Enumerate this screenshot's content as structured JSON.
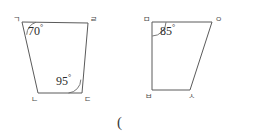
{
  "figures": [
    {
      "id": "left-quadrilateral",
      "vertices": [
        {
          "name": "top-left",
          "label": "ㄱ",
          "x": 22,
          "y": 22,
          "label_x": 13,
          "label_y": 16
        },
        {
          "name": "top-right",
          "label": "ㄹ",
          "x": 88,
          "y": 23,
          "label_x": 90,
          "label_y": 16
        },
        {
          "name": "bottom-right",
          "label": "ㄷ",
          "x": 82,
          "y": 93,
          "label_x": 84,
          "label_y": 96
        },
        {
          "name": "bottom-left",
          "label": "ㄴ",
          "x": 38,
          "y": 93,
          "label_x": 31,
          "label_y": 96
        }
      ],
      "angles": [
        {
          "at": "top-left",
          "value": "70",
          "degree": "°",
          "label_x": 28,
          "label_y": 24
        },
        {
          "at": "bottom-right",
          "value": "95",
          "degree": "°",
          "label_x": 56,
          "label_y": 74
        }
      ]
    },
    {
      "id": "right-quadrilateral",
      "vertices": [
        {
          "name": "top-left",
          "label": "ㅁ",
          "x": 152,
          "y": 22,
          "label_x": 143,
          "label_y": 16
        },
        {
          "name": "top-right",
          "label": "ㅇ",
          "x": 212,
          "y": 22,
          "label_x": 215,
          "label_y": 16
        },
        {
          "name": "bottom-right",
          "label": "ㅅ",
          "x": 190,
          "y": 90,
          "label_x": 188,
          "label_y": 93
        },
        {
          "name": "bottom-left",
          "label": "ㅂ",
          "x": 152,
          "y": 90,
          "label_x": 145,
          "label_y": 93
        }
      ],
      "angles": [
        {
          "at": "top-left",
          "value": "85",
          "degree": "°",
          "label_x": 160,
          "label_y": 24
        }
      ]
    }
  ],
  "marks": {
    "open_paren": "(",
    "paren_x": 117,
    "paren_y": 115
  },
  "colors": {
    "stroke": "#5a5a5a",
    "text": "#2b2b2b",
    "label": "#4a4a4a",
    "background": "#ffffff"
  }
}
